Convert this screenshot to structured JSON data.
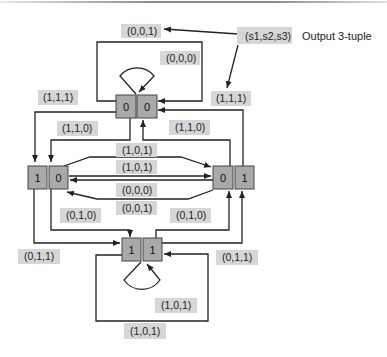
{
  "legend": {
    "tuple_label": "(s1,s2,s3)",
    "description": "Output 3-tuple"
  },
  "states": {
    "top": {
      "s1": "0",
      "s2": "0"
    },
    "left": {
      "s1": "1",
      "s2": "0"
    },
    "right": {
      "s1": "0",
      "s2": "1"
    },
    "bottom": {
      "s1": "1",
      "s2": "1"
    }
  },
  "edge_labels": {
    "top_loop_outer": "(0,0,1)",
    "top_self_loop": "(0,0,0)",
    "top_to_left": "(1,1,1)",
    "legend_to_right": "(1,1,1)",
    "top_to_left_inner": "(1,1,0)",
    "right_to_top": "(1,1,0)",
    "mid_1": "(1,0,1)",
    "mid_2": "(1,0,1)",
    "mid_3": "(0,0,0)",
    "mid_4": "(0,0,1)",
    "left_to_bottom": "(0,1,0)",
    "bottom_to_right": "(0,1,0)",
    "left_to_bottom_outer": "(0,1,1)",
    "bottom_to_right_outer": "(0,1,1)",
    "bottom_self_loop": "(1,0,1)",
    "bottom_loop_outer": "(1,0,1)"
  }
}
